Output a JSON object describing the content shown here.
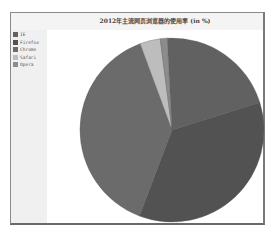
{
  "chart_data": {
    "type": "pie",
    "title": "2012年主流网页浏览器的使用率 (in %)",
    "categories": [
      "IE",
      "Firefox",
      "Chrome",
      "Safari",
      "Opera"
    ],
    "values": [
      21.0,
      35.6,
      38.6,
      3.6,
      1.2
    ],
    "colors": [
      "#616161",
      "#525252",
      "#6b6b6b",
      "#bdbdbd",
      "#8c8c8c"
    ],
    "start_angle_deg": -3,
    "legend_position": "left"
  },
  "legend": {
    "items": [
      {
        "label": "IE",
        "color": "#616161"
      },
      {
        "label": "Firefox",
        "color": "#525252"
      },
      {
        "label": "Chrome",
        "color": "#6b6b6b"
      },
      {
        "label": "Safari",
        "color": "#bdbdbd"
      },
      {
        "label": "Opera",
        "color": "#8c8c8c"
      }
    ]
  }
}
